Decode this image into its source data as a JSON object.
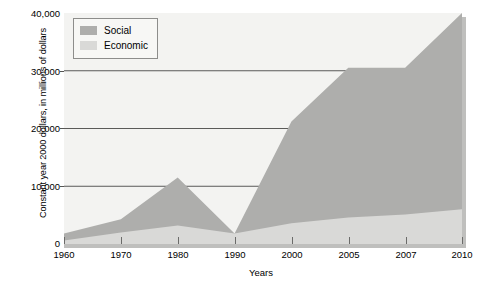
{
  "chart_data": {
    "type": "area",
    "stacked": true,
    "title": "",
    "xlabel": "Years",
    "ylabel": "Constant year 2000 dollars, in millions of dollars",
    "categories": [
      "1960",
      "1970",
      "1980",
      "1990",
      "2000",
      "2005",
      "2007",
      "2010"
    ],
    "x_tick_labels": [
      "1960",
      "1970",
      "1980",
      "1990",
      "2000",
      "2005",
      "2007",
      "2010"
    ],
    "y_tick_labels": [
      "0",
      "10,000",
      "20,000",
      "30,000",
      "40,000"
    ],
    "y_ticks": [
      0,
      10000,
      20000,
      30000,
      40000
    ],
    "ylim": [
      0,
      40000
    ],
    "grid": "horizontal",
    "gridlines": [
      10000,
      20000,
      30000
    ],
    "legend_position": "top-left",
    "series": [
      {
        "name": "Economic",
        "color": "#d9d9d7",
        "values": [
          600,
          2000,
          3200,
          1800,
          3600,
          4600,
          5100,
          6000
        ]
      },
      {
        "name": "Social",
        "color": "#aeaeac",
        "values": [
          1200,
          2300,
          8300,
          0,
          17600,
          25900,
          25400,
          34000
        ]
      }
    ],
    "totals": [
      1800,
      4300,
      11500,
      1800,
      21200,
      30500,
      30500,
      40000
    ]
  },
  "legend": {
    "items": [
      {
        "label": "Social",
        "color": "#aeaeac"
      },
      {
        "label": "Economic",
        "color": "#d9d9d7"
      }
    ]
  },
  "colors": {
    "social": "#aeaeac",
    "economic": "#d9d9d7",
    "plot_background": "#f3f3f1",
    "gridline": "#5a5a58",
    "axis": "#6b6b69",
    "shadow": "#bfbfbd"
  }
}
